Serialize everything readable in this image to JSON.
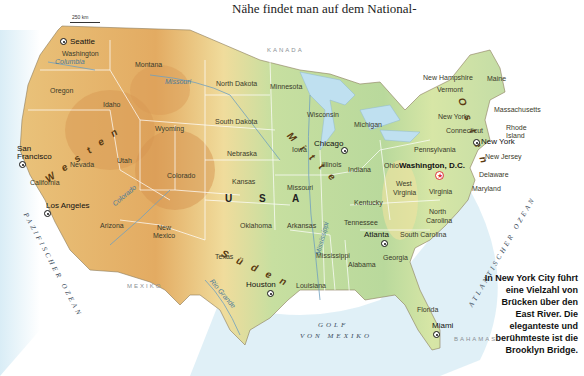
{
  "intro_text": "Nähe findet man auf dem National-",
  "scale": "250 km",
  "countries": {
    "canada": "KANADA",
    "mexico": "MEXIKO",
    "bahamas": "BAHAMAS",
    "usa": "U S A"
  },
  "oceans": {
    "pacific": "PAZIFISCHER OZEAN",
    "atlantic": "ATLANTISCHER OZEAN",
    "gulf_line1": "GOLF",
    "gulf_line2": "VON MEXIKO"
  },
  "regions": {
    "west": "Westen",
    "middle": "Mitte",
    "south": "Süden",
    "east": "Osten"
  },
  "rivers": {
    "columbia": "Columbia",
    "missouri": "Missouri",
    "colorado": "Colorado",
    "rio_grande": "Rio Grande",
    "mississippi": "Mississippi"
  },
  "states": {
    "washington": "Washington",
    "oregon": "Oregon",
    "california": "California",
    "idaho": "Idaho",
    "nevada": "Nevada",
    "montana": "Montana",
    "wyoming": "Wyoming",
    "utah": "Utah",
    "colorado": "Colorado",
    "arizona": "Arizona",
    "new_mexico_1": "New",
    "new_mexico_2": "Mexico",
    "north_dakota": "North Dakota",
    "south_dakota": "South Dakota",
    "nebraska": "Nebraska",
    "kansas": "Kansas",
    "oklahoma": "Oklahoma",
    "texas": "Texas",
    "minnesota": "Minnesota",
    "iowa": "Iowa",
    "missouri": "Missouri",
    "arkansas": "Arkansas",
    "louisiana": "Louisiana",
    "wisconsin": "Wisconsin",
    "illinois": "Illinois",
    "michigan": "Michigan",
    "indiana": "Indiana",
    "ohio": "Ohio",
    "kentucky": "Kentucky",
    "tennessee": "Tennessee",
    "mississippi": "Mississippi",
    "alabama": "Alabama",
    "georgia": "Georgia",
    "florida": "Florida",
    "south_carolina": "South Carolina",
    "north_carolina_1": "North",
    "north_carolina_2": "Carolina",
    "virginia": "Virginia",
    "west_virginia_1": "West",
    "west_virginia_2": "Virginia",
    "pennsylvania": "Pennsylvania",
    "new_york": "New York",
    "maryland": "Maryland",
    "delaware": "Delaware",
    "new_jersey": "New Jersey",
    "connecticut": "Connecticut",
    "rhode_island_1": "Rhode",
    "rhode_island_2": "Island",
    "massachusetts": "Massachusetts",
    "vermont": "Vermont",
    "new_hampshire": "New Hampshire",
    "maine": "Maine"
  },
  "cities": {
    "seattle": "Seattle",
    "san_francisco_1": "San",
    "san_francisco_2": "Francisco",
    "los_angeles": "Los Angeles",
    "houston": "Houston",
    "chicago": "Chicago",
    "atlanta": "Atlanta",
    "miami": "Miami",
    "new_york": "New York",
    "washington_dc": "Washington, D.C."
  },
  "caption": "In New York City führt eine Vielzahl von Brücken über den East River. Die eleganteste und berühmteste ist die Brooklyn Bridge.",
  "colors": {
    "water": "#bfe0f0",
    "lowland": "#b9d89a",
    "plains": "#efe3a0",
    "highland": "#e8b56a",
    "mountain": "#d4914a",
    "border": "#ffffff"
  }
}
